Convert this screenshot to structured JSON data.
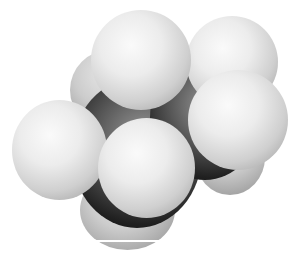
{
  "image": {
    "subject": "space-filling molecular model",
    "description": "Grayscale space-filling model of a small hydrocarbon: two dark carbon spheres partly hidden behind white hydrogen spheres",
    "atoms": [
      {
        "element": "C",
        "shade": "dark"
      },
      {
        "element": "C",
        "shade": "dark"
      },
      {
        "element": "H",
        "shade": "light"
      },
      {
        "element": "H",
        "shade": "light"
      },
      {
        "element": "H",
        "shade": "light"
      },
      {
        "element": "H",
        "shade": "light"
      },
      {
        "element": "H",
        "shade": "light"
      },
      {
        "element": "H",
        "shade": "light"
      }
    ],
    "colors": {
      "background": "#ffffff",
      "hydrogen": "#e8e8e8",
      "carbon": "#1a1a1a"
    }
  }
}
